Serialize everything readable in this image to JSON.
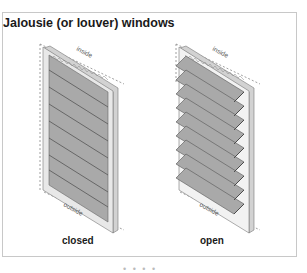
{
  "figure": {
    "title": "Jalousie (or louver) windows",
    "windows": [
      {
        "id": "closed",
        "caption": "closed",
        "top_label": "inside",
        "bottom_label": "outside",
        "louver_count": 8
      },
      {
        "id": "open",
        "caption": "open",
        "top_label": "inside",
        "bottom_label": "outside",
        "louver_count": 9
      }
    ],
    "footer_marker": "• • • •"
  },
  "colors": {
    "louver_fill": "#a9a9a9",
    "louver_edge": "#5a5a5a",
    "frame_fill": "#e6e6e6",
    "frame_edge": "#777777",
    "border": "#c8c8c8",
    "text": "#1a1a1a"
  }
}
